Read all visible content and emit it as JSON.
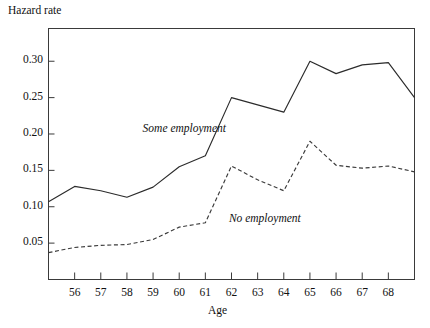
{
  "chart_data": {
    "type": "line",
    "title": "",
    "xlabel": "Age",
    "ylabel": "Hazard rate",
    "x": [
      55,
      56,
      57,
      58,
      59,
      60,
      61,
      62,
      63,
      64,
      65,
      66,
      67,
      68,
      69
    ],
    "xlim": [
      55,
      69
    ],
    "ylim": [
      0.0,
      0.345
    ],
    "grid": false,
    "legend_position": "inline-annotation",
    "ytick_labels": [
      "0.05",
      "0.10",
      "0.15",
      "0.20",
      "0.25",
      "0.30"
    ],
    "ytick_values": [
      0.05,
      0.1,
      0.15,
      0.2,
      0.25,
      0.3
    ],
    "xtick_labels": [
      "56",
      "57",
      "58",
      "59",
      "60",
      "61",
      "62",
      "63",
      "64",
      "65",
      "66",
      "67",
      "68"
    ],
    "xtick_values": [
      56,
      57,
      58,
      59,
      60,
      61,
      62,
      63,
      64,
      65,
      66,
      67,
      68
    ],
    "series": [
      {
        "name": "Some employment",
        "style": "solid",
        "color": "#2b2b2b",
        "values": [
          0.107,
          0.128,
          0.122,
          0.113,
          0.127,
          0.155,
          0.17,
          0.25,
          0.24,
          0.23,
          0.3,
          0.283,
          0.295,
          0.298,
          0.25
        ]
      },
      {
        "name": "No employment",
        "style": "dashed",
        "color": "#3a3a3a",
        "values": [
          0.037,
          0.044,
          0.047,
          0.048,
          0.055,
          0.072,
          0.078,
          0.156,
          0.137,
          0.122,
          0.19,
          0.157,
          0.153,
          0.156,
          0.148
        ]
      }
    ],
    "annotations": [
      {
        "text": "Some employment",
        "x": 58.6,
        "y": 0.205
      },
      {
        "text": "No employment",
        "x": 61.9,
        "y": 0.082
      }
    ]
  }
}
